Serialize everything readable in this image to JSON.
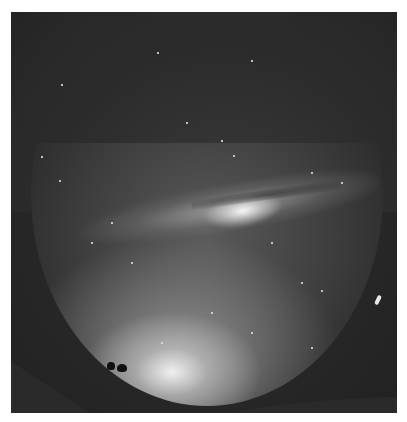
{
  "image": {
    "description": "Fisheye night sky photograph with the Milky Way arching across, bright horizon glow at bottom, silhouetted trees on hillside at lower left",
    "colors": {
      "background": "#ffffff",
      "frame": "#2a2a2a",
      "sky_glow": "#f5f5f5",
      "milky_way_core": "#ffffff"
    }
  }
}
